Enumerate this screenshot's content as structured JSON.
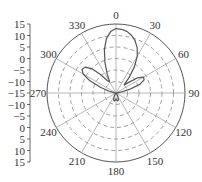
{
  "chart_data": {
    "type": "polar",
    "title": "",
    "angular_unit": "degrees",
    "angular_direction": "clockwise",
    "zero_location": "top",
    "angle_ticks": [
      0,
      30,
      60,
      90,
      120,
      150,
      180,
      210,
      240,
      270,
      300,
      330
    ],
    "angle_tick_labels": [
      "0",
      "30",
      "60",
      "90",
      "120",
      "150",
      "180",
      "210",
      "240",
      "270",
      "300",
      "330"
    ],
    "radial_range": [
      -15,
      15
    ],
    "radial_ticks": [
      -15,
      -10,
      -5,
      0,
      5,
      10,
      15
    ],
    "radial_axis_labels_upper": [
      "15",
      "10",
      "5",
      "0",
      "−5",
      "−10",
      "−15"
    ],
    "radial_axis_labels_lower": [
      "−10",
      "−5",
      "0",
      "5",
      "10",
      "15"
    ],
    "grid": true,
    "grid_style": "dashed",
    "series": [
      {
        "name": "radiation pattern",
        "color": "#555555",
        "theta": [
          0,
          5,
          10,
          15,
          20,
          25,
          30,
          35,
          40,
          45,
          50,
          55,
          60,
          65,
          70,
          75,
          80,
          85,
          90,
          100,
          110,
          120,
          130,
          140,
          150,
          160,
          165,
          170,
          175,
          180,
          185,
          190,
          195,
          200,
          210,
          220,
          230,
          240,
          250,
          260,
          270,
          280,
          285,
          290,
          295,
          300,
          305,
          310,
          315,
          320,
          325,
          330,
          335,
          340,
          345,
          350,
          355,
          360
        ],
        "r": [
          13.0,
          12.8,
          12.2,
          11.0,
          9.2,
          6.8,
          3.5,
          -1.0,
          -6.0,
          -10.0,
          -8.0,
          -3.5,
          -1.2,
          -1.5,
          -4.0,
          -9.0,
          -13.0,
          -14.5,
          -15.0,
          -15.0,
          -14.8,
          -15.0,
          -15.0,
          -14.5,
          -13.5,
          -12.0,
          -11.5,
          -11.5,
          -12.0,
          -12.5,
          -12.0,
          -11.5,
          -11.5,
          -12.0,
          -13.5,
          -14.5,
          -15.0,
          -15.0,
          -14.8,
          -15.0,
          -15.0,
          -14.0,
          -12.0,
          -8.0,
          -2.5,
          1.5,
          3.0,
          2.5,
          0.0,
          -4.5,
          -8.5,
          -9.5,
          -6.0,
          -1.0,
          4.5,
          9.0,
          11.8,
          13.0
        ]
      }
    ]
  }
}
